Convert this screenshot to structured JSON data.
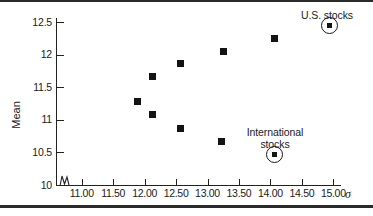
{
  "chart_data": {
    "type": "scatter",
    "title": "",
    "xlabel": "σ",
    "ylabel": "Mean",
    "xlim": [
      10.7,
      15.4
    ],
    "ylim": [
      10.0,
      12.7
    ],
    "grid": false,
    "legend": "none",
    "axis_break_x": true,
    "x_ticks": [
      "11.00",
      "11.50",
      "12.00",
      "12.50",
      "13.00",
      "13.50",
      "14.00",
      "14.50",
      "15.00"
    ],
    "x_tick_values": [
      11.0,
      11.5,
      12.0,
      12.5,
      13.0,
      13.5,
      14.0,
      14.5,
      15.0
    ],
    "y_ticks": [
      "12.5",
      "12",
      "11.5",
      "11",
      "10.5",
      "10"
    ],
    "y_tick_values": [
      12.5,
      12.0,
      11.5,
      11.0,
      10.5,
      10.0
    ],
    "points": [
      {
        "x": 11.88,
        "y": 11.28,
        "highlighted": false,
        "label": ""
      },
      {
        "x": 12.12,
        "y": 11.67,
        "highlighted": false,
        "label": ""
      },
      {
        "x": 12.12,
        "y": 11.08,
        "highlighted": false,
        "label": ""
      },
      {
        "x": 12.57,
        "y": 11.87,
        "highlighted": false,
        "label": ""
      },
      {
        "x": 12.57,
        "y": 10.87,
        "highlighted": false,
        "label": ""
      },
      {
        "x": 13.25,
        "y": 12.05,
        "highlighted": false,
        "label": ""
      },
      {
        "x": 13.22,
        "y": 10.67,
        "highlighted": false,
        "label": ""
      },
      {
        "x": 14.06,
        "y": 12.25,
        "highlighted": false,
        "label": ""
      },
      {
        "x": 14.06,
        "y": 10.47,
        "highlighted": true,
        "label": "International stocks"
      },
      {
        "x": 14.94,
        "y": 12.44,
        "highlighted": true,
        "label": "U.S. stocks"
      }
    ],
    "annotations": [
      {
        "name": "us-stocks",
        "text": "U.S. stocks",
        "points_to": {
          "x": 14.94,
          "y": 12.44
        }
      },
      {
        "name": "international-stocks",
        "text": "International stocks",
        "points_to": {
          "x": 14.06,
          "y": 10.47
        }
      }
    ],
    "colors": {
      "marker": "#141414",
      "axis": "#222222",
      "background": "#ffffff",
      "rule": "#2b2b2b"
    }
  },
  "axis": {
    "y_title": "Mean",
    "x_title": "σ",
    "y_tick_labels": [
      "12.5",
      "12",
      "11.5",
      "11",
      "10.5",
      "10"
    ],
    "x_tick_labels": [
      "11.00",
      "11.50",
      "12.00",
      "12.50",
      "13.00",
      "13.50",
      "14.00",
      "14.50",
      "15.00"
    ]
  },
  "annotations": {
    "us_stocks": "U.S. stocks",
    "international_stocks_line1": "International",
    "international_stocks_line2": "stocks"
  }
}
